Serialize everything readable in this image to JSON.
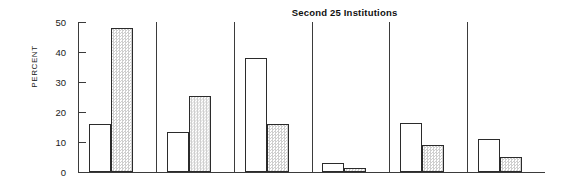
{
  "chart_data": {
    "type": "bar",
    "title": "Second 25 Institutions",
    "xlabel": "",
    "ylabel": "PERCENT",
    "ylim": [
      0,
      50
    ],
    "yticks": [
      0,
      10,
      20,
      30,
      40,
      50
    ],
    "ytick_labels": [
      "0",
      "10",
      "20",
      "30",
      "40",
      "50"
    ],
    "grid": false,
    "legend": "none",
    "categories": [
      "1",
      "2",
      "3",
      "4",
      "5",
      "6"
    ],
    "series": [
      {
        "name": "open",
        "fill": "white",
        "values": [
          16,
          13.5,
          38,
          3,
          16.5,
          11
        ]
      },
      {
        "name": "shaded",
        "fill": "stipple",
        "values": [
          48,
          25.5,
          16,
          1.5,
          9,
          5
        ]
      }
    ]
  },
  "axis": {
    "ylabel_text": "PERCENT",
    "tick_0": "0",
    "tick_10": "10",
    "tick_20": "20",
    "tick_30": "30",
    "tick_40": "40",
    "tick_50": "50"
  },
  "header": {
    "title": "Second 25 Institutions"
  }
}
